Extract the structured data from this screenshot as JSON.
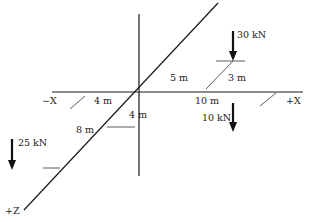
{
  "diagram": {
    "axes": {
      "neg_x": "−X",
      "pos_x": "+X",
      "pos_z": "+Z"
    },
    "dimensions": {
      "neg_x_4m": "4 m",
      "y_4m": "4 m",
      "z_8m": "8 m",
      "z_5m": "5 m",
      "x_10m": "10 m",
      "z_3m": "3 m"
    },
    "loads": [
      {
        "label": "30 kN",
        "direction": "down"
      },
      {
        "label": "10 kN",
        "direction": "down"
      },
      {
        "label": "25 kN",
        "direction": "down"
      }
    ],
    "colors": {
      "line": "#1a1a1a",
      "text": "#222222",
      "background": "#ffffff"
    }
  }
}
